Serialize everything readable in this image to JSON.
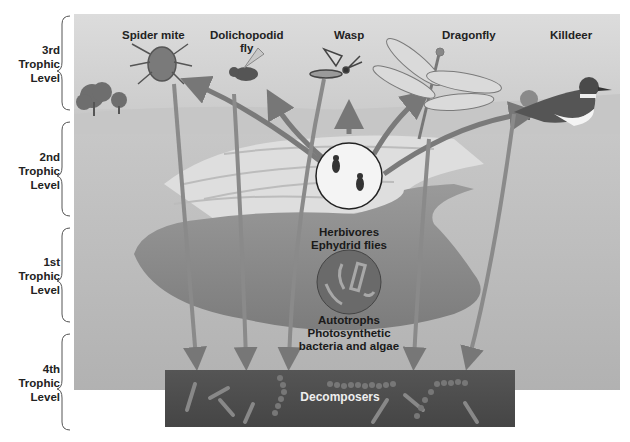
{
  "trophic_levels": [
    {
      "line1": "3rd",
      "line2": "Trophic",
      "line3": "Level"
    },
    {
      "line1": "2nd",
      "line2": "Trophic",
      "line3": "Level"
    },
    {
      "line1": "1st",
      "line2": "Trophic",
      "line3": "Level"
    },
    {
      "line1": "4th",
      "line2": "Trophic",
      "line3": "Level"
    }
  ],
  "predators": [
    {
      "name": "Spider mite"
    },
    {
      "name": "Dolichopodid",
      "name2": "fly"
    },
    {
      "name": "Wasp"
    },
    {
      "name": "Dragonfly"
    },
    {
      "name": "Killdeer"
    }
  ],
  "herbivores": {
    "line1": "Herbivores",
    "line2": "Ephydrid flies"
  },
  "autotrophs": {
    "line1": "Autotrophs",
    "line2": "Photosynthetic",
    "line3": "bacteria and algae"
  },
  "decomposers": {
    "label": "Decomposers"
  },
  "colors": {
    "arrow": "#7a7a7a",
    "decomposer_bg": "#4d4d4d",
    "pond": "#8a8a8a"
  }
}
